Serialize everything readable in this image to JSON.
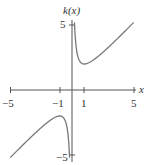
{
  "chart_data": {
    "type": "line",
    "title": "",
    "function": "k(x) = x + 1/x",
    "xlabel": "x",
    "ylabel": "k(x)",
    "xlim": [
      -5,
      5
    ],
    "ylim": [
      -5,
      5
    ],
    "x_ticks": [
      -5,
      -1,
      1,
      5
    ],
    "x_tick_labels": [
      "−5",
      "−1",
      "1",
      "5"
    ],
    "y_ticks": [
      5,
      -5
    ],
    "y_tick_labels": [
      "5",
      "−5"
    ],
    "grid": false,
    "legend": null,
    "series": [
      {
        "name": "k(x) right branch",
        "x": [
          0.21,
          0.3,
          0.5,
          0.75,
          1,
          1.5,
          2,
          3,
          4,
          5
        ],
        "values": [
          4.97,
          3.63,
          2.5,
          2.08,
          2,
          2.17,
          2.5,
          3.33,
          4.25,
          5.2
        ]
      },
      {
        "name": "k(x) left branch",
        "x": [
          -5,
          -4,
          -3,
          -2,
          -1.5,
          -1,
          -0.75,
          -0.5,
          -0.3,
          -0.21
        ],
        "values": [
          -5.2,
          -4.25,
          -3.33,
          -2.5,
          -2.17,
          -2,
          -2.08,
          -2.5,
          -3.63,
          -4.97
        ]
      }
    ]
  }
}
